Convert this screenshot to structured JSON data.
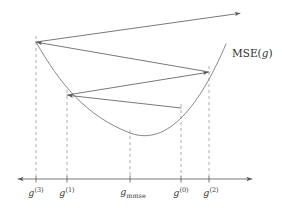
{
  "figure": {
    "title_visible": false,
    "curve_label": {
      "function_name": "MSE",
      "argument": "g",
      "open_paren": "(",
      "close_paren": ")"
    },
    "axis": {
      "orientation": "horizontal",
      "y": 179,
      "x_start": 15,
      "x_end": 255,
      "arrow_left": true,
      "arrow_right": true
    },
    "colors": {
      "curve": "#6a6a6a",
      "axis": "#555555",
      "dashed": "#9a9a9a",
      "label": "#3a3a3a",
      "background": "#ffffff"
    },
    "ticks": [
      {
        "id": "g3",
        "label_main": "g",
        "label_sup": "(3)",
        "label_sub": "",
        "x": 36,
        "label_x": 36,
        "label_y": 186
      },
      {
        "id": "g1",
        "label_main": "g",
        "label_sup": "(1)",
        "label_sub": "",
        "x": 67,
        "label_x": 67,
        "label_y": 186
      },
      {
        "id": "gmmse",
        "label_main": "g",
        "label_sup": "",
        "label_sub": "mmse",
        "x": 130,
        "label_x": 133,
        "label_y": 186
      },
      {
        "id": "g0",
        "label_main": "g",
        "label_sup": "(0)",
        "label_sub": "",
        "x": 181,
        "label_x": 181,
        "label_y": 186
      },
      {
        "id": "g2",
        "label_main": "g",
        "label_sup": "(2)",
        "label_sub": "",
        "x": 209,
        "label_x": 211,
        "label_y": 186
      }
    ],
    "curve": {
      "type": "parabola",
      "vertex_x": 130,
      "vertex_y": 133,
      "left_end_x": 36,
      "left_end_y": 42,
      "right_end_x": 226,
      "right_end_y": 44
    },
    "iterate_points": [
      {
        "id": "p-g0",
        "x": 181,
        "y": 108
      },
      {
        "id": "p-g1",
        "x": 67,
        "y": 95
      },
      {
        "id": "p-g2",
        "x": 209,
        "y": 72
      },
      {
        "id": "p-g3",
        "x": 36,
        "y": 42
      }
    ],
    "path_segments": [
      {
        "id": "seg-g0-to-g1",
        "from_x": 181,
        "from_y": 108,
        "to_x": 67,
        "to_y": 95,
        "arrow_at_end": true
      },
      {
        "id": "seg-g1-to-g2",
        "from_x": 67,
        "from_y": 95,
        "to_x": 209,
        "to_y": 72,
        "arrow_at_end": true
      },
      {
        "id": "seg-g2-to-g3",
        "from_x": 209,
        "from_y": 72,
        "to_x": 36,
        "to_y": 42,
        "arrow_at_end": true
      },
      {
        "id": "seg-g3-outward",
        "from_x": 36,
        "from_y": 42,
        "to_x": 241,
        "to_y": 13,
        "arrow_at_end": true
      }
    ],
    "curve_label_pos": {
      "x": 232,
      "y": 47
    }
  }
}
